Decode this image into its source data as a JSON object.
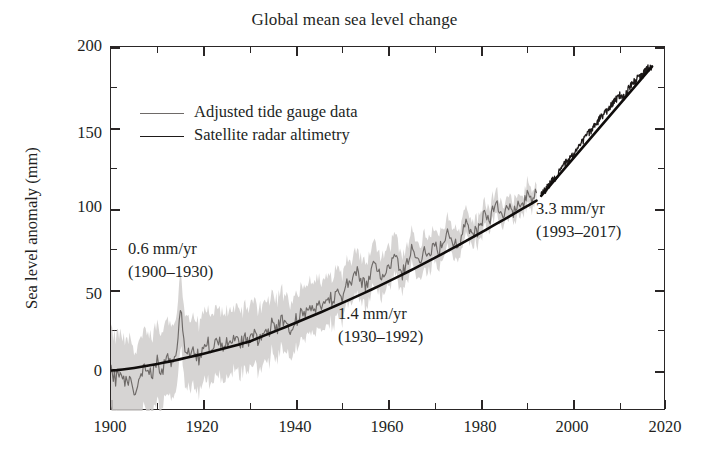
{
  "chart_data": {
    "type": "line",
    "title": "Global mean sea level change",
    "xlabel": "",
    "ylabel": "Sea level anomaly (mm)",
    "xlim": [
      1900,
      2020
    ],
    "ylim": [
      -25,
      200
    ],
    "grid": false,
    "legend_position": "upper-left",
    "xticks": [
      1900,
      1920,
      1940,
      1960,
      1980,
      2000,
      2020
    ],
    "xticks_minor": [
      1910,
      1930,
      1950,
      1970,
      1990,
      2010
    ],
    "yticks": [
      0,
      50,
      100,
      150,
      200
    ],
    "yticks_minor": [
      25,
      75,
      125,
      175
    ],
    "series": [
      {
        "name": "Adjusted tide gauge data",
        "color": "#6e6a68",
        "x": [
          1900,
          1901,
          1902,
          1903,
          1904,
          1905,
          1906,
          1907,
          1908,
          1909,
          1910,
          1911,
          1912,
          1913,
          1914,
          1915,
          1916,
          1917,
          1918,
          1919,
          1920,
          1921,
          1922,
          1923,
          1924,
          1925,
          1926,
          1927,
          1928,
          1929,
          1930,
          1931,
          1932,
          1933,
          1934,
          1935,
          1936,
          1937,
          1938,
          1939,
          1940,
          1941,
          1942,
          1943,
          1944,
          1945,
          1946,
          1947,
          1948,
          1949,
          1950,
          1951,
          1952,
          1953,
          1954,
          1955,
          1956,
          1957,
          1958,
          1959,
          1960,
          1961,
          1962,
          1963,
          1964,
          1965,
          1966,
          1967,
          1968,
          1969,
          1970,
          1971,
          1972,
          1973,
          1974,
          1975,
          1976,
          1977,
          1978,
          1979,
          1980,
          1981,
          1982,
          1983,
          1984,
          1985,
          1986,
          1987,
          1988,
          1989,
          1990,
          1991,
          1992
        ],
        "values": [
          -1,
          -6,
          2,
          -9,
          -4,
          -12,
          -7,
          0,
          3,
          -2,
          5,
          0,
          8,
          4,
          10,
          38,
          12,
          9,
          14,
          7,
          11,
          17,
          12,
          20,
          14,
          18,
          13,
          22,
          16,
          21,
          17,
          22,
          19,
          27,
          23,
          30,
          25,
          33,
          28,
          26,
          31,
          36,
          33,
          41,
          37,
          44,
          40,
          47,
          43,
          50,
          46,
          54,
          50,
          62,
          56,
          52,
          58,
          66,
          61,
          57,
          63,
          70,
          66,
          60,
          67,
          74,
          71,
          68,
          76,
          72,
          79,
          75,
          82,
          86,
          81,
          78,
          85,
          91,
          87,
          84,
          92,
          98,
          94,
          104,
          99,
          95,
          101,
          97,
          104,
          101,
          107,
          103,
          110
        ]
      },
      {
        "name": "Satellite radar altimetry",
        "color": "#1e1a19",
        "x": [
          1993,
          1994,
          1995,
          1996,
          1997,
          1998,
          1999,
          2000,
          2001,
          2002,
          2003,
          2004,
          2005,
          2006,
          2007,
          2008,
          2009,
          2010,
          2011,
          2012,
          2013,
          2014,
          2015,
          2016,
          2017
        ],
        "values": [
          108,
          112,
          116,
          119,
          123,
          128,
          130,
          134,
          138,
          142,
          146,
          149,
          153,
          157,
          160,
          163,
          167,
          170,
          169,
          175,
          178,
          181,
          183,
          187,
          188
        ]
      }
    ],
    "trend_segments": [
      {
        "name": "trend-1900-1930",
        "x": [
          1900,
          1930
        ],
        "values": [
          0,
          18
        ],
        "rate_mm_per_yr": 0.6
      },
      {
        "name": "trend-1930-1992",
        "x": [
          1930,
          1992
        ],
        "values": [
          18,
          105
        ],
        "rate_mm_per_yr": 1.4
      },
      {
        "name": "trend-1993-2017",
        "x": [
          1993,
          2017
        ],
        "values": [
          108,
          188
        ],
        "rate_mm_per_yr": 3.3
      }
    ],
    "annotations": [
      {
        "rate": "0.6 mm/yr",
        "period": "(1900–1930)"
      },
      {
        "rate": "1.4 mm/yr",
        "period": "(1930–1992)"
      },
      {
        "rate": "3.3 mm/yr",
        "period": "(1993–2017)"
      }
    ]
  },
  "chart": {
    "title": "Global mean sea level change",
    "ylabel": "Sea level anomaly (mm)"
  },
  "legend": {
    "items": [
      {
        "label": "Adjusted tide gauge data",
        "color": "#6e6a68"
      },
      {
        "label": "Satellite radar altimetry",
        "color": "#1e1a19"
      }
    ]
  },
  "annotations": [
    {
      "line1": "0.6 mm/yr",
      "line2": "(1900–1930)"
    },
    {
      "line1": "1.4 mm/yr",
      "line2": "(1930–1992)"
    },
    {
      "line1": "3.3 mm/yr",
      "line2": "(1993–2017)"
    }
  ],
  "axes": {
    "x": {
      "labels": [
        "1900",
        "1920",
        "1940",
        "1960",
        "1980",
        "2000",
        "2020"
      ]
    },
    "y": {
      "labels": [
        "200",
        "150",
        "100",
        "50",
        "0"
      ]
    }
  }
}
